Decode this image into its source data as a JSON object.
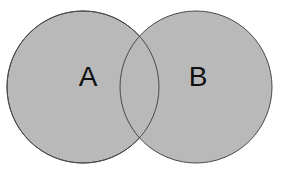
{
  "figure": {
    "type": "venn-diagram",
    "title": "",
    "background_color": "#ffffff",
    "width": 288,
    "height": 173
  },
  "style": {
    "fill_color": "#b9b9b9",
    "stroke_color": "#4a4a4a",
    "stroke_width": 1,
    "label_color": "#111111",
    "label_font_size": 28
  },
  "sets": [
    {
      "id": "set-a",
      "label": "A",
      "label_x": 88,
      "label_y": 79,
      "center_x": 83,
      "center_y": 87,
      "radius": 76
    },
    {
      "id": "set-b",
      "label": "B",
      "label_x": 198,
      "label_y": 79,
      "center_x": 196,
      "center_y": 87,
      "radius": 76
    }
  ],
  "intersection": {
    "label": "",
    "top_point_x": 144,
    "top_point_y": 26,
    "bottom_point_x": 144,
    "bottom_point_y": 145
  }
}
